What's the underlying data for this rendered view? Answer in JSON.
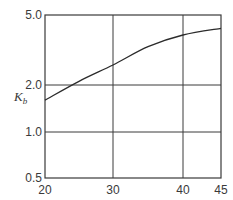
{
  "chart_data": {
    "type": "line",
    "title": "",
    "xlabel": "",
    "ylabel": "K_b",
    "ylabel_main": "K",
    "ylabel_sub": "b",
    "x_scale": "linear",
    "y_scale": "log",
    "xlim": [
      20,
      45
    ],
    "ylim": [
      0.5,
      5.0
    ],
    "grid": true,
    "legend": null,
    "x_ticks": [
      20,
      30,
      40,
      45
    ],
    "x_tick_labels": [
      "20",
      "30",
      "40",
      "45"
    ],
    "y_ticks": [
      0.5,
      1.0,
      2.0,
      5.0
    ],
    "y_tick_labels": [
      "0.5",
      "1.0",
      "2.0",
      "5.0"
    ],
    "series": [
      {
        "name": "K_b",
        "x": [
          20,
          25,
          30,
          35,
          40,
          45
        ],
        "values": [
          1.6,
          2.1,
          2.6,
          3.3,
          3.85,
          4.2
        ]
      }
    ]
  },
  "colors": {
    "line": "#2b2b2b",
    "grid": "#3a3a3a",
    "text": "#3a3a3a",
    "background": "#ffffff"
  }
}
